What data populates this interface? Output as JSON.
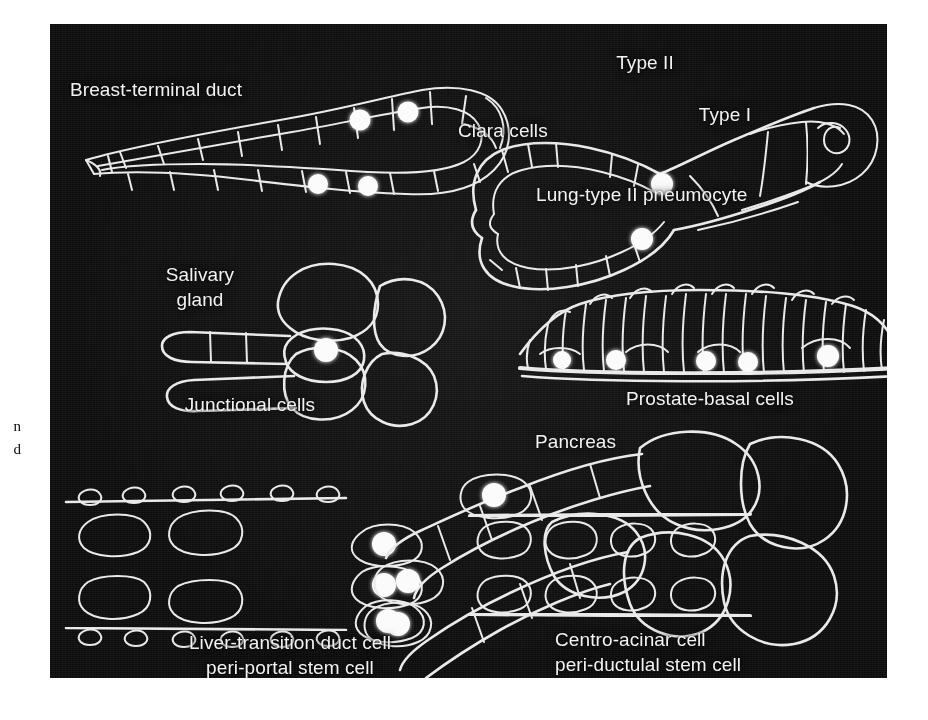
{
  "figure": {
    "kind": "photographic-plate",
    "background_color": "#ffffff",
    "plate_color": "#0d0d0d",
    "label_color": "#f2f2f2",
    "stem_cell_marker_color": "#fbfbfb",
    "membrane_color": "#e9e9e9"
  },
  "margin_fragments": {
    "line1": "n",
    "line2": "d"
  },
  "panels": {
    "breast": {
      "title": "Breast-terminal duct",
      "stem_cell_count": 4
    },
    "lung": {
      "clara": "Clara cells",
      "type2": "Type II",
      "type1": "Type I",
      "caption": "Lung-type II pneumocyte",
      "stem_cell_count": 2
    },
    "salivary": {
      "title": "Salivary\ngland",
      "caption": "Junctional cells",
      "stem_cell_count": 1
    },
    "prostate": {
      "caption": "Prostate-basal cells",
      "columnar_cell_count": 19,
      "stem_cell_count": 5
    },
    "liver": {
      "caption_line1": "Liver-transition duct cell",
      "caption_line2": "peri-portal stem cell",
      "stem_cell_count": 3
    },
    "pancreas": {
      "title": "Pancreas",
      "caption_line1": "Centro-acinar cell",
      "caption_line2": "peri-ductulal stem cell",
      "stem_cell_count": 3
    }
  }
}
